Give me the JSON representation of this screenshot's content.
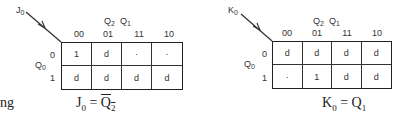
{
  "left_fragment": "ng",
  "kmaps": [
    {
      "corner_label": "J",
      "corner_sub": "0",
      "col_var_1": "Q",
      "col_var_1_sub": "2",
      "col_var_2": "Q",
      "col_var_2_sub": "1",
      "row_var": "Q",
      "row_var_sub": "0",
      "col_headers": [
        "00",
        "01",
        "11",
        "10"
      ],
      "row_headers": [
        "0",
        "1"
      ],
      "cells": [
        [
          "1",
          "d",
          "·",
          "·"
        ],
        [
          "d",
          "d",
          "d",
          "d"
        ]
      ],
      "equation": {
        "lhs": "J",
        "lhs_sub": "0",
        "eq": " = ",
        "rhs": "Q",
        "rhs_sub": "2",
        "rhs_complement": true
      }
    },
    {
      "corner_label": "K",
      "corner_sub": "0",
      "col_var_1": "Q",
      "col_var_1_sub": "2",
      "col_var_2": "Q",
      "col_var_2_sub": "1",
      "row_var": "Q",
      "row_var_sub": "0",
      "col_headers": [
        "00",
        "01",
        "11",
        "10"
      ],
      "row_headers": [
        "0",
        "1"
      ],
      "cells": [
        [
          "d",
          "d",
          "d",
          "d"
        ],
        [
          "·",
          "1",
          "d",
          "d"
        ]
      ],
      "equation": {
        "lhs": "K",
        "lhs_sub": "0",
        "eq": " = ",
        "rhs": "Q",
        "rhs_sub": "1",
        "rhs_complement": false
      }
    }
  ]
}
